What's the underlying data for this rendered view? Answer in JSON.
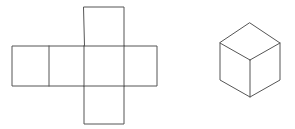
{
  "figure": {
    "background_color": "#ffffff",
    "line_color": "#555555",
    "line_width": 1,
    "width": 295,
    "height": 129,
    "net": {
      "name": "cube-net-cross",
      "description": "Unfolded cube net arranged as a cross of six squares",
      "square_size": 40,
      "faces": [
        {
          "name": "top-face",
          "x": 84,
          "y": 7,
          "w": 40,
          "h": 40
        },
        {
          "name": "left-face",
          "x": 12,
          "y": 46,
          "w": 37,
          "h": 40
        },
        {
          "name": "front-left-face",
          "x": 49,
          "y": 46,
          "w": 35,
          "h": 40
        },
        {
          "name": "front-right-face",
          "x": 84,
          "y": 46,
          "w": 40,
          "h": 40
        },
        {
          "name": "right-face",
          "x": 124,
          "y": 46,
          "w": 33,
          "h": 40
        },
        {
          "name": "bottom-face",
          "x": 84,
          "y": 86,
          "w": 40,
          "h": 38
        }
      ],
      "outline_path": "M84,7 L124,7 L124,46 L157,46 L157,86 L124,86 L124,124 L84,124 L84,86 L12,86 L12,46 L84,46 Z",
      "interior_lines": [
        {
          "name": "divider-left",
          "x1": 49,
          "y1": 46,
          "x2": 49,
          "y2": 86
        },
        {
          "name": "divider-mid",
          "x1": 84,
          "y1": 46,
          "x2": 84,
          "y2": 86
        },
        {
          "name": "divider-right",
          "x1": 124,
          "y1": 46,
          "x2": 124,
          "y2": 86
        },
        {
          "name": "divider-row-top",
          "x1": 84,
          "y1": 46,
          "x2": 124,
          "y2": 46
        },
        {
          "name": "divider-row-bottom",
          "x1": 84,
          "y1": 86,
          "x2": 124,
          "y2": 86
        }
      ]
    },
    "cube": {
      "name": "isometric-cube",
      "description": "Isometric line drawing of a cube showing top, left and right faces",
      "vertices": {
        "apex": {
          "x": 250,
          "y": 23
        },
        "left": {
          "x": 220,
          "y": 43
        },
        "right": {
          "x": 280,
          "y": 43
        },
        "center": {
          "x": 250,
          "y": 60
        },
        "bottom_left": {
          "x": 220,
          "y": 80
        },
        "bottom_right": {
          "x": 280,
          "y": 80
        },
        "bottom": {
          "x": 250,
          "y": 97
        }
      },
      "outline_path": "M250,23 L280,43 L280,80 L250,97 L220,80 L220,43 Z",
      "interior_lines": [
        {
          "name": "edge-center-to-apex-left",
          "x1": 220,
          "y1": 43,
          "x2": 250,
          "y2": 60
        },
        {
          "name": "edge-center-to-apex-right",
          "x1": 280,
          "y1": 43,
          "x2": 250,
          "y2": 60
        },
        {
          "name": "edge-center-to-bottom",
          "x1": 250,
          "y1": 60,
          "x2": 250,
          "y2": 97
        }
      ]
    }
  }
}
